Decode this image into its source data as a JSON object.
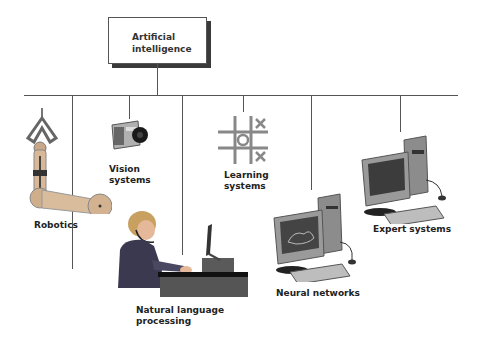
{
  "root": {
    "label_line1": "Artificial",
    "label_line2": "intelligence"
  },
  "branches": [
    {
      "id": "robotics",
      "label_line1": "Robotics",
      "label_line2": ""
    },
    {
      "id": "vision",
      "label_line1": "Vision",
      "label_line2": "systems"
    },
    {
      "id": "nlp",
      "label_line1": "Natural language",
      "label_line2": "processing"
    },
    {
      "id": "learning",
      "label_line1": "Learning",
      "label_line2": "systems"
    },
    {
      "id": "neural",
      "label_line1": "Neural networks",
      "label_line2": ""
    },
    {
      "id": "expert",
      "label_line1": "Expert systems",
      "label_line2": ""
    }
  ],
  "colors": {
    "line": "#555555",
    "shadow": "#3a3a3a",
    "text": "#222222"
  }
}
